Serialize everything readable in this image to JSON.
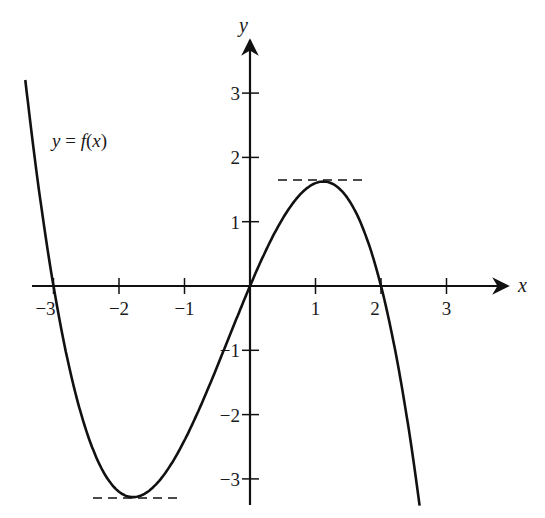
{
  "chart_data": {
    "type": "line",
    "title": "",
    "function_label": "y = f(x)",
    "function_label_parts": {
      "y": "y",
      "eq": " = ",
      "f": "f",
      "open": "(",
      "x": "x",
      "close": ")"
    },
    "xlabel": "x",
    "ylabel": "y",
    "x_ticks": [
      -3,
      -2,
      -1,
      1,
      2,
      3
    ],
    "x_tick_labels": [
      "−3",
      "−2",
      "−1",
      "1",
      "2",
      "3"
    ],
    "y_ticks": [
      -3,
      -2,
      -1,
      1,
      2,
      3
    ],
    "y_tick_labels": [
      "−3",
      "−2",
      "−1",
      "1",
      "2",
      "3"
    ],
    "xlim": [
      -3.3,
      3.9
    ],
    "ylim": [
      -3.5,
      4
    ],
    "grid": false,
    "legend": "none",
    "series": [
      {
        "name": "f(x)",
        "formula": "-0.4*x*(x+3)*(x-2)",
        "x": [
          -3.4,
          -3.0,
          -2.5,
          -2.0,
          -1.75,
          -1.5,
          -1.0,
          -0.5,
          0.0,
          0.5,
          1.0,
          1.1,
          1.5,
          2.0,
          2.5,
          2.6
        ],
        "y": [
          3.0,
          0.0,
          -2.25,
          -3.2,
          -3.28,
          -3.15,
          -2.4,
          -1.25,
          0.0,
          1.05,
          1.6,
          1.61,
          1.35,
          0.0,
          -2.75,
          -3.4
        ]
      }
    ],
    "roots": [
      -3,
      0,
      2
    ],
    "local_max": {
      "x": 1.1,
      "y": 1.6
    },
    "local_min": {
      "x": -1.75,
      "y": -3.3
    },
    "annotations": [
      "dashed horizontal tangent at local maximum",
      "dashed horizontal tangent at local minimum"
    ]
  },
  "colors": {
    "curve": "#111111",
    "axes": "#111111",
    "background": "#ffffff"
  }
}
